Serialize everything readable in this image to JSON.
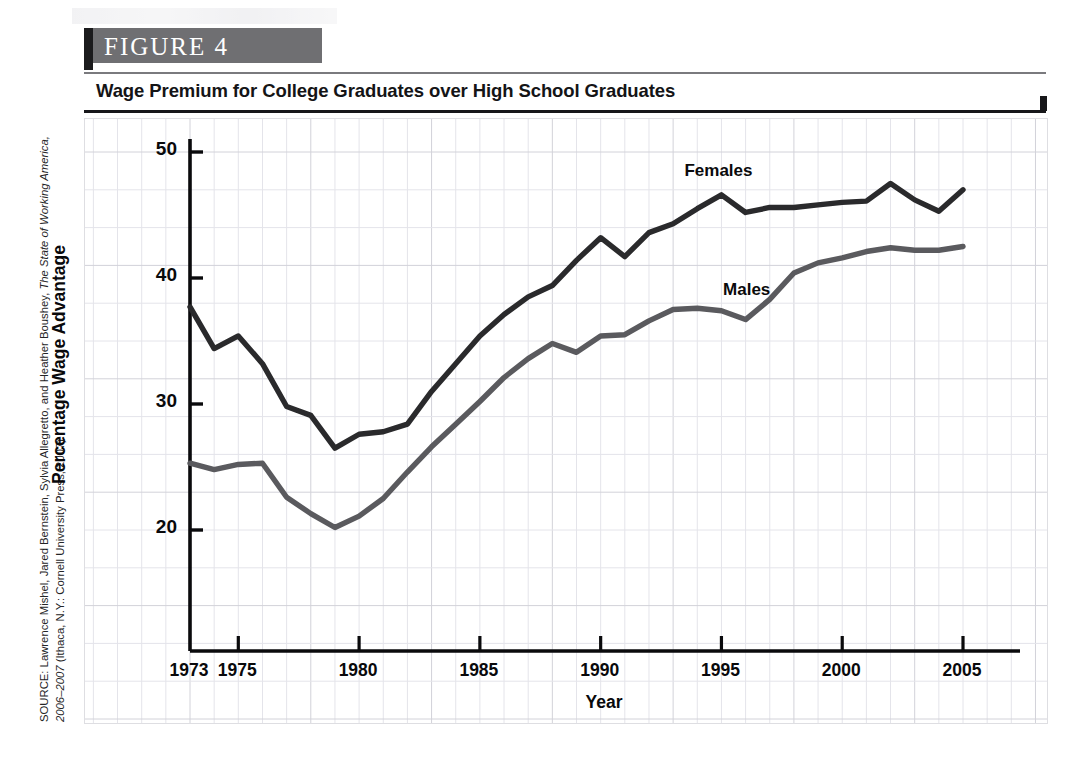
{
  "figure": {
    "banner_label": "FIGURE  4",
    "title": "Wage Premium for College Graduates over High School Graduates",
    "source_prefix": "SOURCE: Lawrence Mishel, Jared Bernstein, Sylvia Allegretto, and Heather Boushey, ",
    "source_italic1": "The State of Working America, 2006–2007",
    "source_suffix": " (Ithaca, N.Y.: Cornell University Press, 2007)."
  },
  "colors": {
    "females_line": "#2a2a2c",
    "males_line": "#5a5a5e",
    "axis": "#0a0a0c",
    "grid_minor": "#e4e4ea",
    "grid_major": "#d2d2d9",
    "banner_bg": "#6f6f72",
    "banner_tab": "#1b1b1d"
  },
  "chart_data": {
    "type": "line",
    "title": "Wage Premium for College Graduates over High School Graduates",
    "xlabel": "Year",
    "ylabel": "Percentage Wage Advantage",
    "xlim": [
      1973,
      2005
    ],
    "ylim": [
      15,
      50
    ],
    "yticks": [
      20,
      30,
      40,
      50
    ],
    "ytick_labels": [
      "20",
      "30",
      "40",
      "50"
    ],
    "xticks": [
      1973,
      1975,
      1980,
      1985,
      1990,
      1995,
      2000,
      2005
    ],
    "xtick_labels": [
      "1973",
      "1975",
      "1980",
      "1985",
      "1990",
      "1995",
      "2000",
      "2005"
    ],
    "grid": true,
    "legend_position": "inline-annotation",
    "x": [
      1973,
      1974,
      1975,
      1976,
      1977,
      1978,
      1979,
      1980,
      1981,
      1982,
      1983,
      1984,
      1985,
      1986,
      1987,
      1988,
      1989,
      1990,
      1991,
      1992,
      1993,
      1994,
      1995,
      1996,
      1997,
      1998,
      1999,
      2000,
      2001,
      2002,
      2003,
      2004,
      2005
    ],
    "series": [
      {
        "name": "Females",
        "color": "#2a2a2c",
        "values": [
          37.7,
          34.4,
          35.4,
          33.2,
          29.8,
          29.1,
          26.5,
          27.6,
          27.8,
          28.4,
          31.0,
          33.2,
          35.4,
          37.1,
          38.5,
          39.4,
          41.4,
          43.2,
          41.7,
          43.6,
          44.3,
          45.5,
          46.6,
          45.2,
          45.6,
          45.6,
          45.8,
          46.0,
          46.1,
          47.5,
          46.2,
          45.3,
          47.0
        ]
      },
      {
        "name": "Males",
        "color": "#5a5a5e",
        "values": [
          25.3,
          24.8,
          25.2,
          25.3,
          22.6,
          21.3,
          20.2,
          21.1,
          22.5,
          24.6,
          26.6,
          28.4,
          30.2,
          32.1,
          33.6,
          34.8,
          34.1,
          35.4,
          35.5,
          36.6,
          37.5,
          37.6,
          37.4,
          36.7,
          38.3,
          40.4,
          41.2,
          41.6,
          42.1,
          42.4,
          42.2,
          42.2,
          42.5
        ]
      }
    ],
    "annotations": [
      {
        "text": "Females",
        "x": 1995.0,
        "y": 48.3
      },
      {
        "text": "Males",
        "x": 1996.6,
        "y": 38.9
      }
    ]
  }
}
